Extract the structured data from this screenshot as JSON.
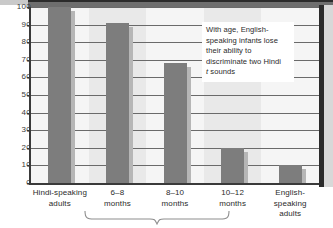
{
  "chart_data": {
    "type": "bar",
    "title": "",
    "xlabel": "",
    "ylabel": "",
    "ylim": [
      0,
      100
    ],
    "grid": true,
    "legend": "none",
    "categories": [
      "Hindi-speaking adults",
      "6–8 months",
      "8–10 months",
      "10–12 months",
      "English-speaking adults"
    ],
    "category_lines": [
      [
        "Hindi-speaking",
        "adults"
      ],
      [
        "6–8",
        "months"
      ],
      [
        "8–10",
        "months"
      ],
      [
        "10–12",
        "months"
      ],
      [
        "English-speaking",
        "adults"
      ]
    ],
    "values": [
      100,
      91,
      68,
      20,
      10
    ],
    "yticks": [
      0,
      10,
      20,
      30,
      40,
      50,
      60,
      70,
      80,
      90,
      100
    ],
    "ytick_labels": [
      "0",
      "10",
      "20",
      "30",
      "40",
      "50",
      "60",
      "70",
      "80",
      "90",
      "100"
    ],
    "annotations": [
      {
        "name": "callout",
        "lines": [
          "With age, English-",
          "speaking infants lose",
          "their ability to",
          "discriminate two Hindi"
        ],
        "last_line_italic_prefix": "t",
        "last_line_rest": " sounds"
      }
    ],
    "bracket": {
      "label": "",
      "spans_categories": [
        "6–8 months",
        "8–10 months",
        "10–12 months"
      ]
    },
    "colors": {
      "bar": "#7d7d7d",
      "bar_shadow": "#b6b6b6",
      "plot_background": "#e9e9e9",
      "gridline": "#6a6a6a",
      "axis": "#3a3a3a",
      "text": "#2b2b2b",
      "callout_background": "#ffffff",
      "top_rule": "#6e6e6e"
    }
  }
}
